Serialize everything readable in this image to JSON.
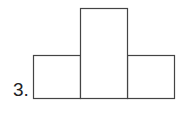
{
  "problem": {
    "number_label": "3."
  },
  "figure": {
    "stroke_color": "#444444",
    "fill_color": "#ffffff",
    "shapes": [
      {
        "name": "left-rectangle",
        "x": 33,
        "y": 55,
        "width": 47,
        "height": 43
      },
      {
        "name": "center-rectangle",
        "x": 80,
        "y": 8,
        "width": 47,
        "height": 90
      },
      {
        "name": "right-rectangle",
        "x": 127,
        "y": 55,
        "width": 47,
        "height": 43
      }
    ]
  }
}
